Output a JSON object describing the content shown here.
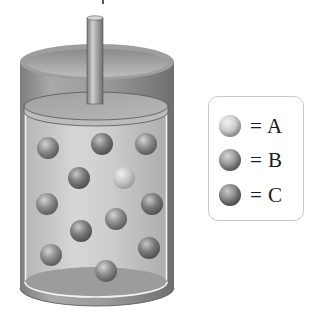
{
  "figure": {
    "type": "piston-cylinder diagram"
  },
  "colors": {
    "background": "#ffffff",
    "cylinder_wall": "#8c8c8c",
    "cylinder_interior": "#c4c4c4",
    "piston": "#a8a8a8",
    "ball_A": "#c8c8c8",
    "ball_B": "#8a8a8a",
    "ball_C": "#7a7a7a",
    "legend_border": "#c9c9c9"
  },
  "legend": {
    "items": [
      {
        "symbol": "ball-A",
        "label": "= A",
        "color": "#c8c8c8"
      },
      {
        "symbol": "ball-B",
        "label": "= B",
        "color": "#8e8e8e"
      },
      {
        "symbol": "ball-C",
        "label": "= C",
        "color": "#777777"
      }
    ]
  },
  "container": {
    "molecules": [
      {
        "x": 48,
        "y": 148,
        "species": "B"
      },
      {
        "x": 102,
        "y": 144,
        "species": "C"
      },
      {
        "x": 146,
        "y": 144,
        "species": "B"
      },
      {
        "x": 79,
        "y": 178,
        "species": "C"
      },
      {
        "x": 124,
        "y": 178,
        "species": "A"
      },
      {
        "x": 47,
        "y": 204,
        "species": "B"
      },
      {
        "x": 152,
        "y": 204,
        "species": "C"
      },
      {
        "x": 116,
        "y": 219,
        "species": "B"
      },
      {
        "x": 81,
        "y": 231,
        "species": "C"
      },
      {
        "x": 51,
        "y": 255,
        "species": "B"
      },
      {
        "x": 149,
        "y": 248,
        "species": "C"
      },
      {
        "x": 106,
        "y": 271,
        "species": "B"
      }
    ],
    "molecule_count": 12
  }
}
